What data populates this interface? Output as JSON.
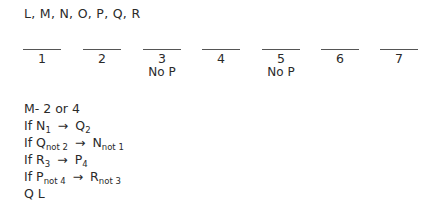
{
  "header": {
    "variables": "L, M, N, O, P, Q, R"
  },
  "slots": [
    {
      "number": "1",
      "note": ""
    },
    {
      "number": "2",
      "note": ""
    },
    {
      "number": "3",
      "note": "No P"
    },
    {
      "number": "4",
      "note": ""
    },
    {
      "number": "5",
      "note": "No P"
    },
    {
      "number": "6",
      "note": ""
    },
    {
      "number": "7",
      "note": ""
    }
  ],
  "rules": {
    "m_rule": "M- 2 or 4",
    "if": "If",
    "arrow": "→",
    "rule1": {
      "a": "N",
      "a_sub": "1",
      "b": "Q",
      "b_sub": "2"
    },
    "rule2": {
      "a": "Q",
      "a_sub": "not 2",
      "b": "N",
      "b_sub": "not 1"
    },
    "rule3": {
      "a": "R",
      "a_sub": "3",
      "b": "P",
      "b_sub": "4"
    },
    "rule4": {
      "a": "P",
      "a_sub": "not 4",
      "b": "R",
      "b_sub": "not 3"
    },
    "block": "Q L"
  }
}
